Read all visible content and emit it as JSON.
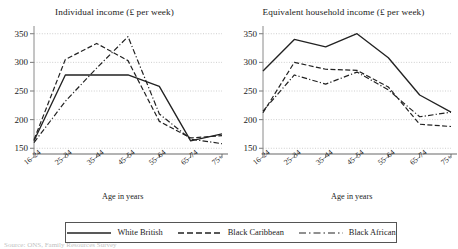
{
  "figure": {
    "source_note": "Source: ONS, Family Resources Survey"
  },
  "legend": {
    "position": "bottom-center",
    "items": [
      {
        "label": "White British",
        "style": "solid",
        "color": "#222222"
      },
      {
        "label": "Black Caribbean",
        "style": "dashed",
        "color": "#222222"
      },
      {
        "label": "Black African",
        "style": "dashdot",
        "color": "#222222"
      }
    ]
  },
  "chart_data": [
    {
      "type": "line",
      "title": "Individual income (£ per week)",
      "xlabel": "Age in years",
      "ylabel": "",
      "categories": [
        "16–24",
        "25–34",
        "35–44",
        "45–54",
        "55–64",
        "65–74",
        "75+"
      ],
      "yticks": [
        150,
        200,
        250,
        300,
        350
      ],
      "ylim": [
        140,
        360
      ],
      "grid": true,
      "series": [
        {
          "name": "White British",
          "style": "solid",
          "values": [
            163,
            278,
            278,
            278,
            258,
            163,
            175
          ]
        },
        {
          "name": "Black Caribbean",
          "style": "dashed",
          "values": [
            165,
            305,
            333,
            303,
            197,
            168,
            172
          ]
        },
        {
          "name": "Black African",
          "style": "dashdot",
          "values": [
            160,
            232,
            290,
            345,
            210,
            166,
            158
          ]
        }
      ]
    },
    {
      "type": "line",
      "title": "Equivalent household income (£ per week)",
      "xlabel": "Age in years",
      "ylabel": "",
      "categories": [
        "16–24",
        "25–34",
        "35–44",
        "45–54",
        "55–64",
        "65–74",
        "75+"
      ],
      "yticks": [
        150,
        200,
        250,
        300,
        350
      ],
      "ylim": [
        140,
        360
      ],
      "grid": true,
      "series": [
        {
          "name": "White British",
          "style": "solid",
          "values": [
            285,
            340,
            327,
            350,
            308,
            243,
            213
          ]
        },
        {
          "name": "Black Caribbean",
          "style": "dashed",
          "values": [
            212,
            300,
            288,
            286,
            257,
            192,
            188
          ]
        },
        {
          "name": "Black African",
          "style": "dashdot",
          "values": [
            215,
            278,
            262,
            283,
            252,
            205,
            213
          ]
        }
      ]
    }
  ]
}
